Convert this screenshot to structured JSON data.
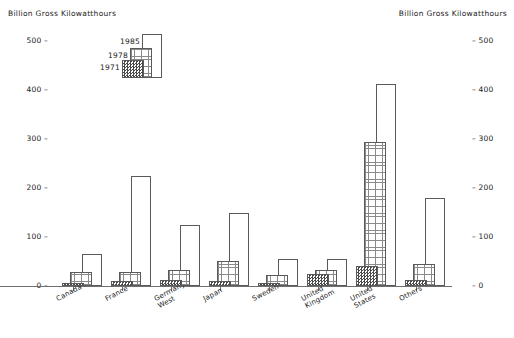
{
  "titles": {
    "left": "Billion Gross Kilowatthours",
    "right": "Billion Gross Kilowatthours"
  },
  "legend": {
    "items": [
      {
        "label": "1985",
        "pattern": "plain-white"
      },
      {
        "label": "1978",
        "pattern": "fine-grid"
      },
      {
        "label": "1971",
        "pattern": "dark-checker"
      }
    ]
  },
  "chart_data": {
    "type": "bar",
    "title": "Billion Gross Kilowatthours",
    "xlabel": "",
    "ylabel": "Billion Gross Kilowatthours",
    "ylim": [
      0,
      500
    ],
    "yticks": [
      0,
      100,
      200,
      300,
      400,
      500
    ],
    "ytick_labels_left": [
      "0",
      "100",
      "200",
      "300",
      "400",
      "500"
    ],
    "ytick_labels_right": [
      "0",
      "100",
      "200",
      "300",
      "400",
      "500"
    ],
    "grid": false,
    "legend_position": "upper-left-inset",
    "dual_axis": true,
    "categories": [
      "Canada",
      "France",
      "Germany, West",
      "Japan",
      "Sweden",
      "United Kingdom",
      "United States",
      "Others"
    ],
    "category_lines": [
      [
        "Canada"
      ],
      [
        "France"
      ],
      [
        "Germany,",
        "West"
      ],
      [
        "Japan"
      ],
      [
        "Sweden"
      ],
      [
        "United",
        "Kingdom"
      ],
      [
        "United",
        "States"
      ],
      [
        "Others"
      ]
    ],
    "series": [
      {
        "name": "1971",
        "values": [
          5,
          10,
          12,
          10,
          1,
          25,
          40,
          12
        ]
      },
      {
        "name": "1978",
        "values": [
          28,
          28,
          32,
          52,
          22,
          32,
          293,
          45
        ]
      },
      {
        "name": "1985",
        "values": [
          65,
          225,
          125,
          150,
          55,
          55,
          412,
          180
        ]
      }
    ]
  }
}
